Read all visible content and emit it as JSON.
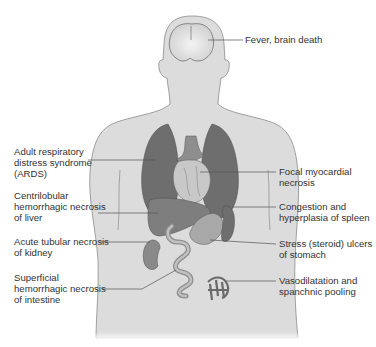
{
  "diagram": {
    "colors": {
      "body_fill": "#dcdcdc",
      "body_outline": "#8a8a8a",
      "organ_dark": "#6e6e6e",
      "organ_mid": "#8e8e8e",
      "organ_light": "#bdbdbd",
      "leader_line": "#555555",
      "text": "#333333"
    },
    "labels": {
      "brain": "Fever, brain death",
      "lungs": "Adult respiratory\ndistress syndrome\n(ARDS)",
      "heart": "Focal myocardial\nnecrosis",
      "liver": "Centrilobular\nhemorrhagic necrosis\nof liver",
      "spleen": "Congestion and\nhyperplasia of spleen",
      "kidney": "Acute tubular necrosis\nof kidney",
      "stomach": "Stress (steroid) ulcers\nof stomach",
      "intestine": "Superficial\nhemorrhagic necrosis\nof intestine",
      "vessels": "Vasodilatation and\nspanchnic pooling"
    }
  }
}
